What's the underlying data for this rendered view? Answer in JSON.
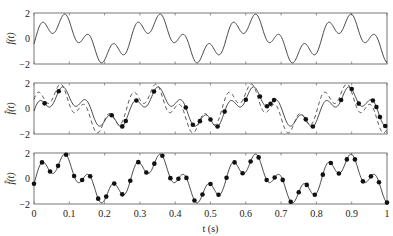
{
  "chart_data": [
    {
      "type": "line",
      "panel": 1,
      "title": "",
      "ylabel": "f(t)",
      "xlabel": "",
      "ylim": [
        -2,
        2
      ],
      "yticks": [
        "2",
        "0",
        "-2"
      ],
      "xlim": [
        0,
        1
      ],
      "grid": false,
      "series": [
        {
          "name": "f(t)",
          "style": "solid",
          "note": "continuous signal; large peaks near t=0.07,0.34,0.61,0.88 (value 2), troughs near t=0.21,0.48,0.75 (value -2)"
        }
      ]
    },
    {
      "type": "line",
      "panel": 2,
      "ylabel": "f̂(t)",
      "ylim": [
        -2,
        2
      ],
      "yticks": [
        "2",
        "0",
        "-2"
      ],
      "xlim": [
        0,
        1
      ],
      "grid": false,
      "series": [
        {
          "name": "reconstruction",
          "style": "solid"
        },
        {
          "name": "original f(t)",
          "style": "dashed"
        },
        {
          "name": "samples",
          "style": "markers",
          "x": [
            0.03,
            0.07,
            0.22,
            0.25,
            0.26,
            0.29,
            0.34,
            0.43,
            0.45,
            0.47,
            0.52,
            0.54,
            0.5,
            0.6,
            0.64,
            0.66,
            0.67,
            0.68,
            0.77,
            0.79,
            0.87,
            0.9,
            0.92,
            0.96,
            0.97,
            0.98,
            0.995
          ]
        }
      ]
    },
    {
      "type": "line",
      "panel": 3,
      "ylabel": "f̂(t)",
      "ylim": [
        -2,
        2
      ],
      "yticks": [
        "2",
        "0",
        "-2"
      ],
      "xlabel": "t  (s)",
      "xlim": [
        0,
        1
      ],
      "xticks": [
        "0",
        "0.1",
        "0.2",
        "0.3",
        "0.4",
        "0.5",
        "0.6",
        "0.7",
        "0.8",
        "0.9",
        "1"
      ],
      "grid": false,
      "series": [
        {
          "name": "reconstruction",
          "style": "solid"
        },
        {
          "name": "samples",
          "style": "markers",
          "count": 45,
          "note": "uniform sampling, dt ≈ 0.022 s"
        }
      ]
    }
  ],
  "labels": {
    "p1_ylabel": "f(t)",
    "p2_ylabel": "f̂(t)",
    "p3_ylabel": "f̂(t)",
    "xlabel": "t  (s)",
    "yt_top": "2",
    "yt_mid": "0",
    "yt_bot": "−2",
    "xticks": [
      "0",
      "0.1",
      "0.2",
      "0.3",
      "0.4",
      "0.5",
      "0.6",
      "0.7",
      "0.8",
      "0.9",
      "1"
    ]
  }
}
